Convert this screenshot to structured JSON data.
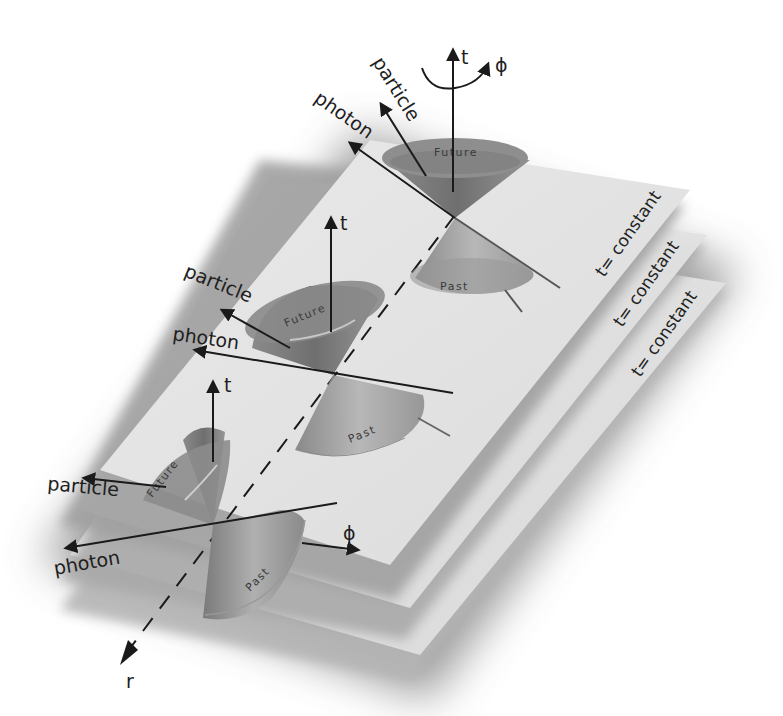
{
  "diagram": {
    "type": "light-cones-on-spacelike-hypersurfaces",
    "planes": [
      {
        "label": "t= constant"
      },
      {
        "label": "t= constant"
      },
      {
        "label": "t= constant"
      }
    ],
    "cones": [
      {
        "position": "top",
        "future_label": "Future",
        "past_label": "Past",
        "time_axis_label": "t",
        "rotation_label": "ϕ",
        "particle_label": "particle",
        "photon_label": "photon"
      },
      {
        "position": "middle",
        "future_label": "Future",
        "past_label": "Past",
        "time_axis_label": "t",
        "particle_label": "particle",
        "photon_label": "photon"
      },
      {
        "position": "bottom",
        "future_label": "Future",
        "past_label": "Past",
        "time_axis_label": "t",
        "particle_label": "particle",
        "photon_label": "photon",
        "phi_axis_label": "ϕ"
      }
    ],
    "radial_axis_label": "r"
  },
  "colors": {
    "background": "#ffffff",
    "plane_face": "#e4e4e4",
    "plane_shadow": "#9a9a9a",
    "cone_dark": "#808080",
    "cone_mid": "#9c9c9c",
    "ink": "#1a1a1a"
  }
}
